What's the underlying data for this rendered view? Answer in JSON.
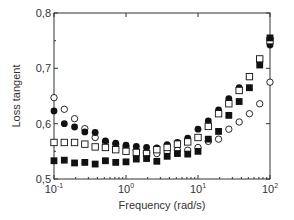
{
  "chart_data": {
    "type": "scatter",
    "title": "",
    "xlabel": "Frequency  (rad/s)",
    "ylabel": "Loss  tangent",
    "xscale": "log",
    "xlim": [
      0.1,
      100
    ],
    "ylim": [
      0.5,
      0.8
    ],
    "grid": false,
    "legend": "none",
    "x_tick_labels": [
      {
        "base": "10",
        "exp": "-1",
        "value": 0.1
      },
      {
        "base": "10",
        "exp": "0",
        "value": 1
      },
      {
        "base": "10",
        "exp": "1",
        "value": 10
      },
      {
        "base": "10",
        "exp": "2",
        "value": 100
      }
    ],
    "y_tick_labels": [
      {
        "label": "0,5",
        "value": 0.5
      },
      {
        "label": "0,6",
        "value": 0.6
      },
      {
        "label": "0,7",
        "value": 0.7
      },
      {
        "label": "0,8",
        "value": 0.8
      }
    ],
    "x": [
      0.1,
      0.139,
      0.193,
      0.268,
      0.373,
      0.518,
      0.72,
      1.0,
      1.39,
      1.93,
      2.68,
      3.73,
      5.18,
      7.2,
      10,
      13.9,
      19.3,
      26.8,
      37.3,
      51.8,
      72,
      100
    ],
    "series": [
      {
        "name": "open-circles",
        "marker": "circle-open",
        "values": [
          0.647,
          0.626,
          0.609,
          0.591,
          0.575,
          0.567,
          0.563,
          0.558,
          0.552,
          0.548,
          0.546,
          0.549,
          0.552,
          0.552,
          0.557,
          0.568,
          0.572,
          0.59,
          0.603,
          0.618,
          0.636,
          0.675
        ]
      },
      {
        "name": "filled-circles",
        "marker": "circle-filled",
        "values": [
          0.623,
          0.6,
          0.594,
          0.585,
          0.584,
          0.569,
          0.565,
          0.561,
          0.559,
          0.557,
          0.556,
          0.562,
          0.566,
          0.574,
          0.59,
          0.605,
          0.625,
          0.645,
          0.665,
          0.685,
          0.715,
          0.742
        ]
      },
      {
        "name": "open-squares",
        "marker": "square-open",
        "values": [
          0.566,
          0.566,
          0.566,
          0.563,
          0.558,
          0.557,
          0.553,
          0.55,
          0.548,
          0.546,
          0.553,
          0.557,
          0.563,
          0.567,
          0.575,
          0.595,
          0.618,
          0.636,
          0.66,
          0.685,
          0.717,
          0.75
        ]
      },
      {
        "name": "filled-squares",
        "marker": "square-filled",
        "values": [
          0.533,
          0.534,
          0.529,
          0.53,
          0.527,
          0.533,
          0.53,
          0.531,
          0.536,
          0.537,
          0.532,
          0.541,
          0.546,
          0.545,
          0.55,
          0.572,
          0.586,
          0.615,
          0.64,
          0.665,
          0.706,
          0.755
        ]
      }
    ]
  },
  "colors": {
    "axis": "#333333",
    "marker": "#111111",
    "background": "#ffffff"
  }
}
